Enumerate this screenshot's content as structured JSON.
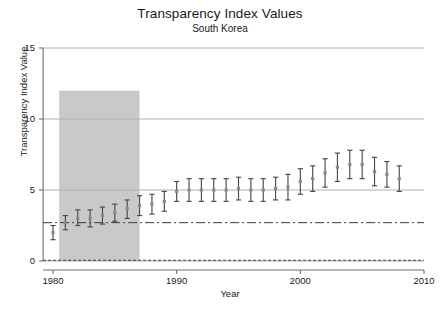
{
  "chart_data": {
    "type": "scatter",
    "title": "Transparency Index Values",
    "subtitle": "South Korea",
    "xlabel": "Year",
    "ylabel": "Transparency Index Value",
    "xlim": [
      1979.2,
      2010.5
    ],
    "ylim": [
      0,
      15
    ],
    "xticks": [
      1980,
      1990,
      2000,
      2010
    ],
    "xtick_labels": [
      "1980",
      "1990",
      "2000",
      "2010"
    ],
    "yticks": [
      0,
      5,
      10,
      15
    ],
    "ytick_labels": [
      "0",
      "5",
      "10",
      "15"
    ],
    "grid": "horizontal gridlines at y = 0, 5, 10, 15",
    "legend": "none",
    "marker_style": "point estimate with vertical error bar (capped)",
    "series": [
      {
        "name": "Transparency Index Value",
        "x": [
          1980,
          1981,
          1982,
          1983,
          1984,
          1985,
          1986,
          1987,
          1988,
          1989,
          1990,
          1991,
          1992,
          1993,
          1994,
          1995,
          1996,
          1997,
          1998,
          1999,
          2000,
          2001,
          2002,
          2003,
          2004,
          2005,
          2006,
          2007,
          2008
        ],
        "values": [
          2.0,
          2.7,
          3.0,
          3.0,
          3.2,
          3.4,
          3.7,
          3.9,
          4.0,
          4.2,
          4.9,
          5.0,
          5.0,
          5.0,
          5.0,
          5.1,
          5.0,
          5.0,
          5.1,
          5.2,
          5.6,
          5.8,
          6.2,
          6.6,
          6.8,
          6.8,
          6.3,
          6.1,
          5.8
        ],
        "lower": [
          1.5,
          2.2,
          2.5,
          2.4,
          2.6,
          2.8,
          3.0,
          3.2,
          3.3,
          3.5,
          4.2,
          4.2,
          4.2,
          4.2,
          4.2,
          4.3,
          4.2,
          4.2,
          4.3,
          4.3,
          4.7,
          4.9,
          5.2,
          5.6,
          5.8,
          5.8,
          5.3,
          5.2,
          4.9
        ],
        "upper": [
          2.5,
          3.2,
          3.6,
          3.6,
          3.8,
          4.0,
          4.3,
          4.6,
          4.7,
          4.9,
          5.6,
          5.8,
          5.8,
          5.8,
          5.8,
          5.9,
          5.8,
          5.8,
          5.9,
          6.1,
          6.5,
          6.7,
          7.2,
          7.6,
          7.8,
          7.8,
          7.3,
          7.0,
          6.7
        ]
      }
    ],
    "reference_line": {
      "name": "dash-dot reference line",
      "value": 2.7,
      "style": "dash-dot",
      "color": "#3a3a3a"
    },
    "baseline_line": {
      "name": "dashed baseline at zero",
      "value": 0.05,
      "style": "dashed",
      "color": "#3a3a3a"
    },
    "shaded_region": {
      "name": "shaded period band",
      "x_start": 1980.5,
      "x_end": 1987.0,
      "y_start": 0,
      "y_end": 12,
      "color": "#c9c9c9"
    },
    "colors": {
      "marker": "#8a8a8a",
      "errorbar": "#4a4a4a",
      "gridline": "#b0b0b0",
      "axis": "#6e6e6e",
      "background": "#ffffff"
    }
  }
}
